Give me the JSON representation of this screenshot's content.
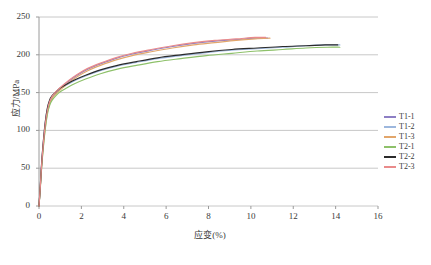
{
  "chart_data": {
    "type": "line",
    "title": "",
    "xlabel": "应变(%)",
    "ylabel": "应力/MPa",
    "xlim": [
      0,
      16
    ],
    "ylim": [
      0,
      250
    ],
    "xticks": [
      "0",
      "2",
      "4",
      "6",
      "8",
      "10",
      "12",
      "14",
      "16"
    ],
    "yticks": [
      "0",
      "50",
      "100",
      "150",
      "200",
      "250"
    ],
    "grid": "horizontal",
    "legend_position": "right",
    "series": [
      {
        "name": "T1-1",
        "color": "#8d7fc4",
        "x": [
          0,
          0.06,
          0.12,
          0.2,
          0.3,
          0.4,
          0.5,
          0.62,
          0.75,
          0.9,
          1.1,
          1.4,
          1.8,
          2.3,
          2.9,
          3.6,
          4.4,
          5.3,
          6.3,
          7.3,
          8.3,
          9.3,
          10.2,
          10.8
        ],
        "y": [
          0,
          25,
          52,
          80,
          108,
          126,
          137,
          144,
          149,
          153,
          158,
          165,
          173,
          181,
          188,
          195,
          201,
          206,
          211,
          215,
          218,
          220,
          222,
          222
        ]
      },
      {
        "name": "T1-2",
        "color": "#9db7dd",
        "x": [
          0,
          0.06,
          0.12,
          0.2,
          0.3,
          0.4,
          0.5,
          0.62,
          0.8,
          1.0,
          1.3,
          1.7,
          2.2,
          2.9,
          3.7,
          4.6,
          5.6,
          6.7,
          7.9,
          9.1,
          10.3,
          11.5,
          12.6,
          13.6,
          14.2
        ],
        "y": [
          0,
          26,
          54,
          83,
          111,
          129,
          139,
          145,
          150,
          155,
          160,
          166,
          172,
          179,
          185,
          190,
          195,
          199,
          203,
          206,
          208,
          210,
          212,
          213,
          213
        ]
      },
      {
        "name": "T1-3",
        "color": "#e2a66b",
        "x": [
          0,
          0.06,
          0.12,
          0.2,
          0.3,
          0.4,
          0.5,
          0.62,
          0.75,
          0.9,
          1.1,
          1.4,
          1.8,
          2.3,
          2.9,
          3.6,
          4.4,
          5.3,
          6.3,
          7.3,
          8.3,
          9.3,
          10.2,
          10.9
        ],
        "y": [
          0,
          24,
          50,
          78,
          105,
          124,
          135,
          142,
          147,
          151,
          156,
          163,
          171,
          179,
          186,
          193,
          199,
          204,
          209,
          213,
          216,
          219,
          221,
          222
        ]
      },
      {
        "name": "T2-1",
        "color": "#8ec16a",
        "x": [
          0,
          0.06,
          0.12,
          0.2,
          0.3,
          0.4,
          0.5,
          0.62,
          0.8,
          1.0,
          1.3,
          1.7,
          2.2,
          2.9,
          3.7,
          4.6,
          5.6,
          6.7,
          7.9,
          9.1,
          10.3,
          11.5,
          12.6,
          13.6,
          14.2
        ],
        "y": [
          0,
          23,
          49,
          76,
          103,
          122,
          133,
          140,
          146,
          151,
          156,
          162,
          168,
          175,
          181,
          186,
          191,
          195,
          199,
          202,
          205,
          207,
          209,
          210,
          210
        ]
      },
      {
        "name": "T2-2",
        "color": "#2b2b2b",
        "x": [
          0,
          0.06,
          0.12,
          0.2,
          0.3,
          0.4,
          0.5,
          0.62,
          0.8,
          1.0,
          1.3,
          1.7,
          2.2,
          2.9,
          3.7,
          4.6,
          5.6,
          6.7,
          7.9,
          9.1,
          10.3,
          11.5,
          12.6,
          13.5,
          14.1
        ],
        "y": [
          0,
          26,
          55,
          84,
          112,
          130,
          140,
          146,
          151,
          156,
          161,
          167,
          173,
          180,
          186,
          191,
          196,
          200,
          204,
          207,
          209,
          211,
          212,
          213,
          213
        ]
      },
      {
        "name": "T2-3",
        "color": "#e98b8b",
        "x": [
          0,
          0.06,
          0.12,
          0.2,
          0.3,
          0.4,
          0.5,
          0.62,
          0.75,
          0.9,
          1.1,
          1.4,
          1.8,
          2.3,
          2.9,
          3.6,
          4.4,
          5.3,
          6.3,
          7.3,
          8.3,
          9.3,
          10.2,
          10.7
        ],
        "y": [
          0,
          25,
          53,
          81,
          109,
          127,
          138,
          145,
          150,
          154,
          159,
          166,
          174,
          182,
          189,
          196,
          202,
          207,
          212,
          216,
          219,
          221,
          223,
          223
        ]
      }
    ]
  },
  "legend": {
    "items": [
      {
        "label": "T1-1",
        "color": "#8d7fc4"
      },
      {
        "label": "T1-2",
        "color": "#9db7dd"
      },
      {
        "label": "T1-3",
        "color": "#e2a66b"
      },
      {
        "label": "T2-1",
        "color": "#8ec16a"
      },
      {
        "label": "T2-2",
        "color": "#2b2b2b"
      },
      {
        "label": "T2-3",
        "color": "#e98b8b"
      }
    ]
  },
  "axes": {
    "x_title": "应变(%)",
    "y_title": "应力/MPa"
  },
  "colors": {
    "grid": "#c8c8c8",
    "axis": "#9a9a9a",
    "text": "#3a3a3a",
    "background": "#ffffff"
  }
}
